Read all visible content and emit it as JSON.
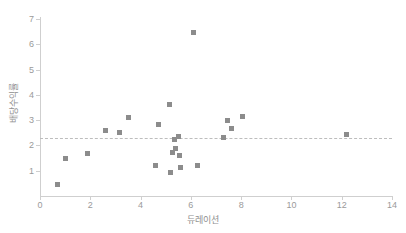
{
  "chart_data": {
    "type": "scatter",
    "title": "",
    "xlabel": "듀레이션",
    "ylabel": "배당수익률",
    "xlim": [
      0,
      14
    ],
    "ylim": [
      0,
      7
    ],
    "xticks": [
      0,
      2,
      4,
      6,
      8,
      10,
      12,
      14
    ],
    "yticks": [
      1,
      2,
      3,
      4,
      5,
      6,
      7
    ],
    "grid": false,
    "legend": null,
    "marker": {
      "shape": "square",
      "color": "#8c8c8c",
      "size_px": 5
    },
    "reference_line": {
      "orientation": "horizontal",
      "value": 2.3,
      "style": "dashed",
      "color": "#bdbdbd"
    },
    "points": [
      {
        "x": 0.7,
        "y": 0.45
      },
      {
        "x": 1.0,
        "y": 1.5
      },
      {
        "x": 1.9,
        "y": 1.7
      },
      {
        "x": 2.6,
        "y": 2.6
      },
      {
        "x": 3.15,
        "y": 2.5
      },
      {
        "x": 3.5,
        "y": 3.1
      },
      {
        "x": 4.6,
        "y": 1.22
      },
      {
        "x": 4.7,
        "y": 2.83
      },
      {
        "x": 5.15,
        "y": 3.62
      },
      {
        "x": 5.2,
        "y": 0.92
      },
      {
        "x": 5.25,
        "y": 1.72
      },
      {
        "x": 5.35,
        "y": 2.22
      },
      {
        "x": 5.4,
        "y": 1.88
      },
      {
        "x": 5.5,
        "y": 2.35
      },
      {
        "x": 5.55,
        "y": 1.6
      },
      {
        "x": 5.6,
        "y": 1.12
      },
      {
        "x": 6.1,
        "y": 6.45
      },
      {
        "x": 6.25,
        "y": 1.22
      },
      {
        "x": 7.3,
        "y": 2.3
      },
      {
        "x": 7.45,
        "y": 3.0
      },
      {
        "x": 7.6,
        "y": 2.65
      },
      {
        "x": 8.05,
        "y": 3.15
      },
      {
        "x": 12.2,
        "y": 2.45
      }
    ]
  }
}
